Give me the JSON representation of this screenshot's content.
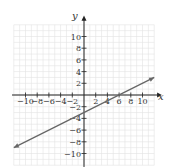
{
  "chart_data": {
    "type": "line",
    "title": "",
    "xlabel": "x",
    "ylabel": "y",
    "xlim": [
      -12,
      12
    ],
    "ylim": [
      -12,
      12
    ],
    "grid": true,
    "x_ticks": [
      -10,
      -8,
      -6,
      -4,
      -2,
      2,
      4,
      6,
      8,
      10
    ],
    "y_ticks": [
      10,
      8,
      6,
      4,
      2,
      -2,
      -4,
      -6,
      -8,
      -10
    ],
    "x_tick_labels": [
      "−10",
      "−8",
      "−6",
      "−4",
      "−2",
      "2",
      "4",
      "6",
      "8",
      "10"
    ],
    "y_tick_labels": [
      "10",
      "8",
      "6",
      "4",
      "2",
      "−2",
      "−4",
      "−6",
      "−8",
      "−10"
    ],
    "series": [
      {
        "name": "line",
        "equation": "y = 0.5x - 3",
        "x": [
          -12,
          12
        ],
        "y": [
          -9,
          3
        ],
        "arrows": "both",
        "color": "#666666"
      }
    ],
    "intercepts": {
      "x_intercept": 6,
      "y_intercept": -3
    }
  },
  "colors": {
    "grid": "#e2e2e2",
    "axis": "#222222",
    "line": "#666666"
  }
}
